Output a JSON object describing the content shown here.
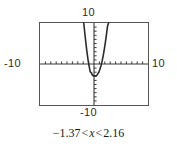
{
  "figure": {
    "type": "graphing-calculator-plot",
    "axis_labels": {
      "top": "10",
      "bottom": "-10",
      "left": "-10",
      "right": "10"
    },
    "caption": {
      "full_text": "-1.37 < x < 2.16",
      "lower_bound": "−1.37",
      "relation_left": "<",
      "variable": "x",
      "relation_right": "<",
      "upper_bound": "2.16"
    },
    "colors": {
      "frame": "#555555",
      "axis": "#3a3a3a",
      "curve": "#2b2b2b",
      "background": "#ffffff"
    }
  },
  "chart_data": {
    "type": "line",
    "title": "",
    "xlabel": "",
    "ylabel": "",
    "xlim": [
      -10,
      10
    ],
    "ylim": [
      -10,
      10
    ],
    "grid": false,
    "legend": null,
    "xticks": [
      -9,
      -8,
      -7,
      -6,
      -5,
      -4,
      -3,
      -2,
      -1,
      1,
      2,
      3,
      4,
      5,
      6,
      7,
      8,
      9
    ],
    "yticks": [
      -9,
      -8,
      -7,
      -6,
      -5,
      -4,
      -3,
      -2,
      -1,
      1,
      2,
      3,
      4,
      5,
      6,
      7,
      8,
      9
    ],
    "tick_spacing": 1,
    "series": [
      {
        "name": "parabola",
        "shape": "upward-parabola",
        "vertex": [
          0.4,
          -2.9
        ],
        "roots": [
          -1.37,
          2.16
        ],
        "x": [
          -1.9,
          -1.7,
          -1.5,
          -1.3,
          -1.1,
          -0.9,
          -0.7,
          -0.5,
          -0.3,
          -0.1,
          0.1,
          0.3,
          0.4,
          0.5,
          0.7,
          0.9,
          1.1,
          1.3,
          1.5,
          1.7,
          1.9,
          2.1,
          2.3,
          2.5,
          2.7
        ],
        "values": [
          10.2,
          7.5,
          5.1,
          2.9,
          1.0,
          -0.6,
          -1.9,
          -2.1,
          -2.7,
          -2.9,
          -2.9,
          -2.9,
          -2.9,
          -2.8,
          -2.4,
          -2.0,
          -1.3,
          -0.4,
          0.7,
          2.0,
          3.5,
          5.2,
          7.1,
          9.2,
          10.5
        ]
      }
    ]
  }
}
